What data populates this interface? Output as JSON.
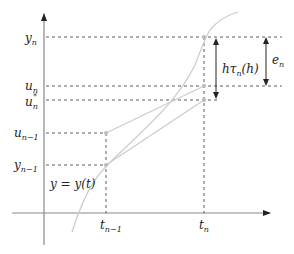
{
  "diagram": {
    "axes": {
      "x_axis": {
        "origin_y": 213,
        "x_start": 12,
        "x_end": 272
      },
      "y_axis": {
        "origin_x": 44,
        "y_start": 245,
        "y_end": 12
      }
    },
    "colors": {
      "axis": "#888888",
      "dashed": "#333333",
      "curve": "#cccccc",
      "arrow": "#222222",
      "point": "#bbbbbb"
    },
    "y_labels": [
      {
        "id": "y_n",
        "base": "y",
        "sub": "n",
        "sup": "",
        "y": 37
      },
      {
        "id": "u_n",
        "base": "u",
        "sub": "n",
        "sup": "",
        "y": 86
      },
      {
        "id": "u_n_star",
        "base": "u",
        "sub": "n",
        "sup": "*",
        "y": 100
      },
      {
        "id": "u_n_minus_1",
        "base": "u",
        "sub": "n−1",
        "sup": "",
        "y": 133
      },
      {
        "id": "y_n_minus_1",
        "base": "y",
        "sub": "n−1",
        "sup": "",
        "y": 165
      }
    ],
    "x_labels": [
      {
        "id": "t_n_minus_1",
        "base": "t",
        "sub": "n−1",
        "x": 106
      },
      {
        "id": "t_n",
        "base": "t",
        "sub": "n",
        "x": 204
      }
    ],
    "curve_label": "y = y(t)",
    "annotations": {
      "local_error": {
        "text_main": "hτ",
        "text_sub": "n",
        "text_tail": "(h)",
        "x": 216,
        "y_top": 37,
        "y_bottom": 100
      },
      "global_error": {
        "base": "e",
        "sub": "n",
        "x": 266,
        "y_top": 37,
        "y_bottom": 86
      }
    }
  }
}
